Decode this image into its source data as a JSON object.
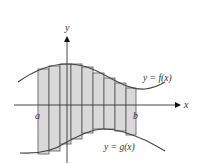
{
  "diagram": {
    "axes": {
      "x_label": "x",
      "y_label": "y"
    },
    "curves": [
      {
        "name": "f",
        "label": "y = f(x)"
      },
      {
        "name": "g",
        "label": "y = g(x)"
      }
    ],
    "interval": {
      "start_label": "a",
      "end_label": "b"
    },
    "rectangle_count": 9,
    "colors": {
      "fill": "#d9d9d9",
      "stroke": "#555555",
      "axis": "#333333",
      "curve": "#444444"
    }
  }
}
